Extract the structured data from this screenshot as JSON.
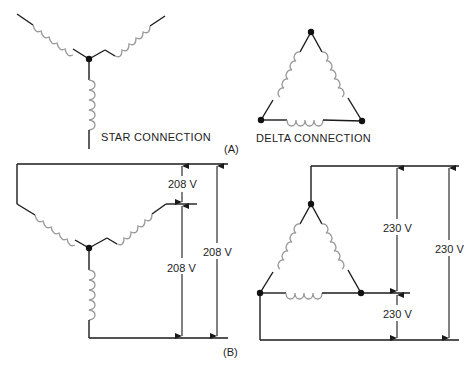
{
  "figure": {
    "part_a": {
      "tag": "(A)",
      "star_label": "STAR CONNECTION",
      "delta_label": "DELTA CONNECTION"
    },
    "part_b": {
      "tag": "(B)",
      "star": {
        "phase_voltage_label": "208 V",
        "lower_voltage_label": "208 V",
        "line_voltage_label": "208 V"
      },
      "delta": {
        "upper_voltage_label": "230 V",
        "lower_voltage_label": "230 V",
        "line_voltage_label": "230 V"
      }
    }
  },
  "colors": {
    "wire": "#1a1a1a",
    "coil": "#9a9a9a",
    "background": "#ffffff"
  }
}
